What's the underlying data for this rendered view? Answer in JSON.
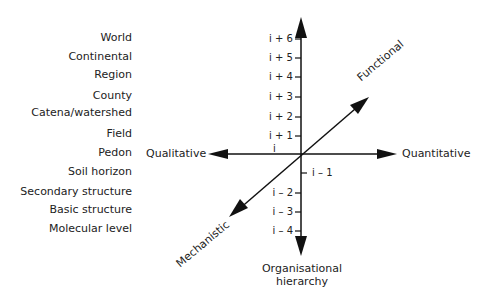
{
  "diagram": {
    "levels": [
      {
        "label": "World",
        "y": 38
      },
      {
        "label": "Continental",
        "y": 57
      },
      {
        "label": "Region",
        "y": 75
      },
      {
        "label": "County",
        "y": 96
      },
      {
        "label": "Catena/watershed",
        "y": 113
      },
      {
        "label": "Field",
        "y": 134
      },
      {
        "label": "Pedon",
        "y": 153
      },
      {
        "label": "Soil horizon",
        "y": 172
      },
      {
        "label": "Secondary structure",
        "y": 192
      },
      {
        "label": "Basic structure",
        "y": 210
      },
      {
        "label": "Molecular level",
        "y": 229
      }
    ],
    "ticks": [
      {
        "label": "i + 6",
        "y": 39,
        "side": "left"
      },
      {
        "label": "i + 5",
        "y": 58,
        "side": "left"
      },
      {
        "label": "i + 4",
        "y": 77,
        "side": "left"
      },
      {
        "label": "i + 3",
        "y": 97,
        "side": "left"
      },
      {
        "label": "i + 2",
        "y": 117,
        "side": "left"
      },
      {
        "label": "i + 1",
        "y": 136,
        "side": "left"
      },
      {
        "label": "i",
        "y": 150,
        "side": "left"
      },
      {
        "label": "i – 1",
        "y": 173,
        "side": "right"
      },
      {
        "label": "i – 2",
        "y": 193,
        "side": "left"
      },
      {
        "label": "i – 3",
        "y": 212,
        "side": "left"
      },
      {
        "label": "i – 4",
        "y": 231,
        "side": "left"
      }
    ],
    "axes": {
      "left": "Qualitative",
      "right": "Quantitative",
      "diag_up": "Functional",
      "diag_down": "Mechanistic",
      "vertical_line1": "Organisational",
      "vertical_line2": "hierarchy"
    },
    "color": "#111111"
  }
}
